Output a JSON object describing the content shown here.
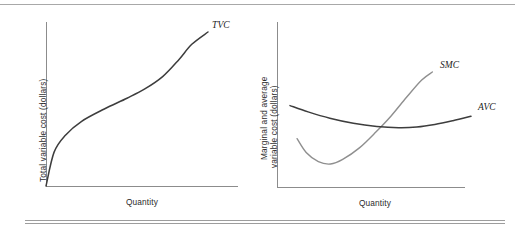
{
  "figure": {
    "background_color": "#ffffff",
    "rule_color": "#9d9d9d"
  },
  "chart_data": [
    {
      "type": "line",
      "panel": "left",
      "title": "",
      "xlabel": "Quantity",
      "ylabel": "Total variable cost (dollars)",
      "grid": false,
      "legend": "inline-curve-labels",
      "axis_ticks": false,
      "xlim": [
        0,
        1
      ],
      "ylim": [
        0,
        1
      ],
      "series": [
        {
          "name": "TVC",
          "label": "TVC",
          "color": "#3d3d3d",
          "linewidth": 1.5,
          "description": "Total variable cost: S-shaped, rising from origin, concave then convex",
          "points": [
            [
              0.0,
              0.0
            ],
            [
              0.05,
              0.22
            ],
            [
              0.12,
              0.33
            ],
            [
              0.22,
              0.42
            ],
            [
              0.36,
              0.5
            ],
            [
              0.5,
              0.57
            ],
            [
              0.61,
              0.63
            ],
            [
              0.72,
              0.71
            ],
            [
              0.82,
              0.82
            ],
            [
              0.9,
              0.92
            ],
            [
              1.0,
              1.0
            ]
          ]
        }
      ]
    },
    {
      "type": "line",
      "panel": "right",
      "title": "",
      "xlabel": "Quantity",
      "ylabel": "Marginal and average variable cost (dollars)",
      "ylabel_lines": [
        "Marginal and average",
        "variable cost (dollars)"
      ],
      "grid": false,
      "legend": "inline-curve-labels",
      "axis_ticks": false,
      "xlim": [
        0,
        1
      ],
      "ylim": [
        0,
        1
      ],
      "annotations": [
        "SMC intersects AVC at the minimum point of AVC"
      ],
      "series": [
        {
          "name": "SMC",
          "label": "SMC",
          "color": "#8f8f8f",
          "linewidth": 1.4,
          "description": "Short-run marginal cost: U-shaped, low minimum, rises steeply",
          "points": [
            [
              0.04,
              0.42
            ],
            [
              0.1,
              0.3
            ],
            [
              0.18,
              0.22
            ],
            [
              0.26,
              0.2
            ],
            [
              0.34,
              0.24
            ],
            [
              0.45,
              0.34
            ],
            [
              0.56,
              0.48
            ],
            [
              0.66,
              0.62
            ],
            [
              0.76,
              0.78
            ],
            [
              0.86,
              0.93
            ],
            [
              0.93,
              1.0
            ]
          ]
        },
        {
          "name": "AVC",
          "label": "AVC",
          "color": "#3d3d3d",
          "linewidth": 1.5,
          "description": "Average variable cost: shallow U-shape, minimum where SMC crosses",
          "points": [
            [
              0.0,
              0.8
            ],
            [
              0.1,
              0.7
            ],
            [
              0.22,
              0.6
            ],
            [
              0.35,
              0.52
            ],
            [
              0.48,
              0.47
            ],
            [
              0.6,
              0.45
            ],
            [
              0.7,
              0.46
            ],
            [
              0.8,
              0.5
            ],
            [
              0.9,
              0.56
            ],
            [
              1.0,
              0.63
            ]
          ]
        }
      ]
    }
  ],
  "panels": {
    "left": {
      "ylabel": "Total variable cost (dollars)",
      "xlabel": "Quantity",
      "curve_labels": [
        {
          "text": "TVC"
        }
      ]
    },
    "right": {
      "ylabel_line1": "Marginal and average",
      "ylabel_line2": "variable cost (dollars)",
      "xlabel": "Quantity",
      "curve_labels": [
        {
          "text": "SMC"
        },
        {
          "text": "AVC"
        }
      ]
    }
  }
}
